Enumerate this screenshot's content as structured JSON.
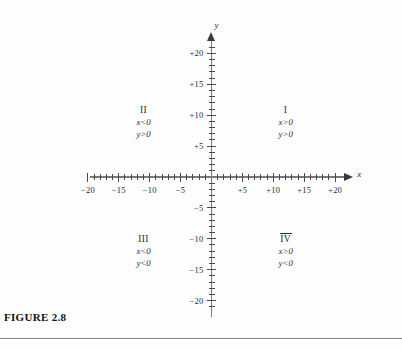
{
  "figure": {
    "caption": "FIGURE 2.8",
    "x_axis_name": "x",
    "y_axis_name": "y"
  },
  "quadrants": [
    {
      "numeral": "I",
      "overlined": false,
      "x_cond": "x > 0",
      "y_cond": "y > 0"
    },
    {
      "numeral": "II",
      "overlined": false,
      "x_cond": "x < 0",
      "y_cond": "y > 0"
    },
    {
      "numeral": "III",
      "overlined": false,
      "x_cond": "x < 0",
      "y_cond": "y < 0"
    },
    {
      "numeral": "IV",
      "overlined": true,
      "x_cond": "x > 0",
      "y_cond": "y < 0"
    }
  ],
  "axes": {
    "x_tick_labels": [
      "−20",
      "−15",
      "−10",
      "−5",
      "+5",
      "+10",
      "+15",
      "+20"
    ],
    "y_tick_labels": [
      "+20",
      "+15",
      "+10",
      "+5",
      "−5",
      "−10",
      "−15",
      "−20"
    ]
  },
  "chart_data": {
    "type": "scatter",
    "title": "FIGURE 2.8",
    "xlabel": "x",
    "ylabel": "y",
    "grid": false,
    "legend": null,
    "xlim": [
      -21,
      22
    ],
    "ylim": [
      -21,
      21
    ],
    "x_major_ticks": [
      -20,
      -15,
      -10,
      -5,
      5,
      10,
      15,
      20
    ],
    "y_major_ticks": [
      20,
      15,
      10,
      5,
      -5,
      -10,
      -15,
      -20
    ],
    "x_tick_labels": [
      "−20",
      "−15",
      "−10",
      "−5",
      "+5",
      "+10",
      "+15",
      "+20"
    ],
    "y_tick_labels": [
      "+20",
      "+15",
      "+10",
      "+5",
      "−5",
      "−10",
      "−15",
      "−20"
    ],
    "minor_tick_interval": 1,
    "series": [],
    "annotations": [
      {
        "text": "I",
        "x": 12,
        "y": 13,
        "note": "quadrant numeral"
      },
      {
        "text": "x > 0",
        "x": 12,
        "y": 11
      },
      {
        "text": "y > 0",
        "x": 12,
        "y": 9.8
      },
      {
        "text": "II",
        "x": -11,
        "y": 13
      },
      {
        "text": "x < 0",
        "x": -11,
        "y": 11
      },
      {
        "text": "y > 0",
        "x": -11,
        "y": 9.8
      },
      {
        "text": "III",
        "x": -11,
        "y": -8.5
      },
      {
        "text": "x < 0",
        "x": -11,
        "y": -10.5
      },
      {
        "text": "y < 0",
        "x": -11,
        "y": -11.7
      },
      {
        "text": "IV",
        "x": 12,
        "y": -8.5
      },
      {
        "text": "x > 0",
        "x": 12,
        "y": -10.5
      },
      {
        "text": "y < 0",
        "x": 12,
        "y": -11.7
      }
    ]
  }
}
